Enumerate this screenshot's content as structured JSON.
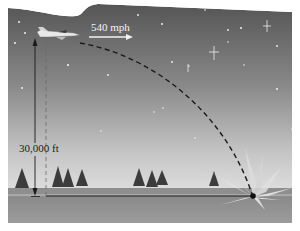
{
  "diagram": {
    "type": "projectile-motion-illustration",
    "altitude_label": "30,000 ft",
    "speed_label": "540 mph",
    "colors": {
      "sky_top": "#5a5a5a",
      "sky_horizon": "#d6d6d6",
      "ground_far": "#8d8d8d",
      "ground_near": "#9a9a9a",
      "line": "#1a1a1a",
      "text_dark": "#1a1a1a",
      "text_light": "#f4f4f4"
    },
    "elements": {
      "aircraft": "jet-plane",
      "trajectory": "dashed-parabola",
      "impact": "explosion",
      "horizon_trees": 8
    }
  }
}
